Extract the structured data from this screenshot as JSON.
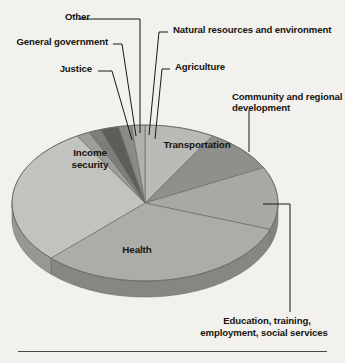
{
  "figure": {
    "background_color": "#f2f1ed",
    "rule_color": "#4a4742",
    "text_color": "#16140f"
  },
  "chart_data": {
    "type": "pie",
    "title": "",
    "subtitle": "",
    "xlabel": "",
    "ylabel": "",
    "legend_position": "none",
    "grid": false,
    "three_d": true,
    "start_angle_deg": -90,
    "direction": "clockwise",
    "labels": [
      "Transportation",
      "Community and regional development",
      "Education, training, employment, social services",
      "Health",
      "Income security",
      "Justice",
      "General government",
      "Other",
      "Natural resources and environment",
      "Agriculture"
    ],
    "values": [
      8.5,
      9.0,
      13.0,
      32.0,
      29.0,
      1.6,
      1.5,
      2.2,
      1.6,
      1.6
    ],
    "colors": [
      "#b9b9b5",
      "#8f8f8b",
      "#a8a8a4",
      "#acaca8",
      "#c2c2be",
      "#9d9d99",
      "#7d7d79",
      "#5d5d59",
      "#8a8a86",
      "#b0b0ac"
    ]
  },
  "callout_labels": [
    {
      "id": "other",
      "text": "Other"
    },
    {
      "id": "general-government",
      "text": "General government"
    },
    {
      "id": "justice",
      "text": "Justice"
    },
    {
      "id": "natural-resources",
      "text": "Natural resources and environment"
    },
    {
      "id": "agriculture",
      "text": "Agriculture"
    },
    {
      "id": "community-regional-1",
      "text": "Community and regional"
    },
    {
      "id": "community-regional-2",
      "text": "development"
    },
    {
      "id": "education-1",
      "text": "Education, training,"
    },
    {
      "id": "education-2",
      "text": "employment, social services"
    }
  ],
  "inner_labels": [
    {
      "id": "transportation",
      "text": "Transportation"
    },
    {
      "id": "income-security-1",
      "text": "Income"
    },
    {
      "id": "income-security-2",
      "text": "security"
    },
    {
      "id": "health",
      "text": "Health"
    }
  ]
}
